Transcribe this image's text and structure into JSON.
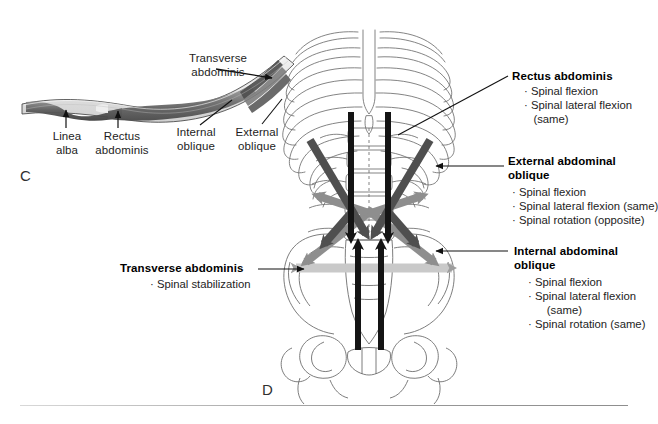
{
  "figure": {
    "panel_c_letter": "C",
    "panel_d_letter": "D"
  },
  "panel_c": {
    "name": "cross-section-of-abdominal-wall",
    "labels": {
      "transverse_abdominis": "Transverse\nabdominis",
      "linea_alba": "Linea\nalba",
      "rectus_abdominis": "Rectus\nabdominis",
      "internal_oblique": "Internal\noblique",
      "external_oblique": "External\noblique"
    }
  },
  "panel_d": {
    "name": "anterior-trunk-skeleton-with-muscle-force-vectors",
    "callouts": [
      {
        "id": "rectus-abdominis",
        "title": "Rectus abdominis",
        "actions": [
          "· Spinal flexion",
          "· Spinal lateral flexion",
          "   (same)"
        ],
        "arrow_color": "#141414"
      },
      {
        "id": "external-abdominal-oblique",
        "title": "External abdominal\noblique",
        "actions": [
          "· Spinal flexion",
          "· Spinal lateral flexion (same)",
          "· Spinal rotation (opposite)"
        ],
        "arrow_color": "#4a4a4a"
      },
      {
        "id": "internal-abdominal-oblique",
        "title": "Internal abdominal\noblique",
        "actions": [
          "· Spinal flexion",
          "· Spinal lateral flexion",
          "      (same)",
          "· Spinal rotation (same)"
        ],
        "arrow_color": "#8c8c8c"
      },
      {
        "id": "transverse-abdominis",
        "title": "Transverse abdominis",
        "actions": [
          "· Spinal stabilization"
        ],
        "arrow_color": "#c4c4c4"
      }
    ]
  },
  "colors": {
    "rectus_arrow": "#141414",
    "external_oblique_arrow": "#4f4f4f",
    "internal_oblique_arrow": "#8e8e8e",
    "transverse_band": "#c9c9c9",
    "bone_outline": "#6b6b6b",
    "text": "#1d1d1d",
    "background": "#ffffff"
  }
}
